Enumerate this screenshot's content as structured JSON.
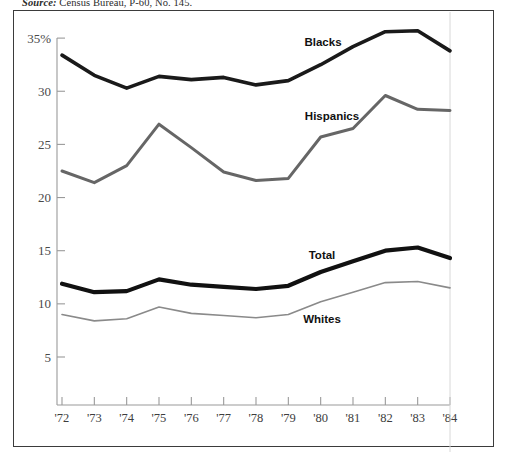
{
  "source": {
    "label": "Source:",
    "text": " Census Bureau, P-60, No. 145."
  },
  "colors": {
    "blacks": "#1a1a1a",
    "hispanics": "#666666",
    "total": "#111111",
    "whites": "#8a8a8a",
    "axis": "#9a9a9a",
    "frame": "#3b3b3b",
    "tick_text": "#4a4a4a"
  },
  "chart_data": {
    "type": "line",
    "title": "",
    "xlabel": "",
    "ylabel": "",
    "grid": false,
    "legend": "inline-labels",
    "xlim": [
      "'72",
      "'84"
    ],
    "ylim": [
      0,
      35
    ],
    "yticks": [
      5,
      10,
      15,
      20,
      25,
      30,
      35
    ],
    "ytick_labels": [
      "5",
      "10",
      "15",
      "20",
      "25",
      "30",
      "35%"
    ],
    "categories": [
      "'72",
      "'73",
      "'74",
      "'75",
      "'76",
      "'77",
      "'78",
      "'79",
      "'80",
      "'81",
      "'82",
      "'83",
      "'84"
    ],
    "series": [
      {
        "name": "Blacks",
        "color": "#1a1a1a",
        "width": 3.6,
        "label_x": 323,
        "label_y": 46,
        "values": [
          33.4,
          31.5,
          30.3,
          31.4,
          31.1,
          31.3,
          30.6,
          31.0,
          32.5,
          34.2,
          35.6,
          35.7,
          33.8
        ]
      },
      {
        "name": "Hispanics",
        "color": "#666666",
        "width": 3.0,
        "label_x": 332,
        "label_y": 120,
        "values": [
          22.5,
          21.4,
          23.0,
          26.9,
          24.7,
          22.4,
          21.6,
          21.8,
          25.7,
          26.5,
          29.6,
          28.3,
          28.2
        ]
      },
      {
        "name": "Total",
        "color": "#111111",
        "width": 4.2,
        "label_x": 322,
        "label_y": 259,
        "values": [
          11.9,
          11.1,
          11.2,
          12.3,
          11.8,
          11.6,
          11.4,
          11.7,
          13.0,
          14.0,
          15.0,
          15.3,
          14.3
        ]
      },
      {
        "name": "Whites",
        "color": "#8a8a8a",
        "width": 1.6,
        "label_x": 322,
        "label_y": 323,
        "values": [
          9.0,
          8.4,
          8.6,
          9.7,
          9.1,
          8.9,
          8.7,
          9.0,
          10.2,
          11.1,
          12.0,
          12.1,
          11.5
        ]
      }
    ]
  }
}
